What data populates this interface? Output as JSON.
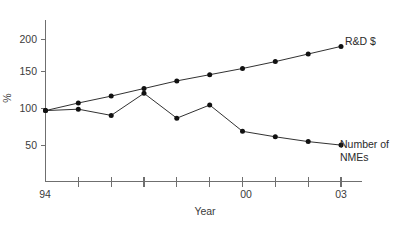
{
  "chart_data": {
    "type": "line",
    "title": "",
    "xlabel": "Year",
    "ylabel": "%",
    "x": [
      94,
      95,
      96,
      97,
      98,
      99,
      0,
      1,
      2,
      3
    ],
    "x_full": [
      1994,
      1995,
      1996,
      1997,
      1998,
      1999,
      2000,
      2001,
      2002,
      2003
    ],
    "xtick_labels_visible": [
      "94",
      "00",
      "03"
    ],
    "xtick_label_indices": [
      0,
      6,
      9
    ],
    "ytick_labels": [
      "50",
      "100",
      "150",
      "200"
    ],
    "ytick_values": [
      50,
      100,
      150,
      200
    ],
    "ylim": [
      0,
      225
    ],
    "xlim": [
      1994,
      2003
    ],
    "grid": false,
    "legend": "inline-right-labels",
    "series": [
      {
        "name": "R&D $",
        "label": "R&D $",
        "color": "#111111",
        "marker": "circle",
        "values": [
          97,
          108,
          118,
          129,
          140,
          149,
          158,
          168,
          179,
          190
        ]
      },
      {
        "name": "Number of NMEs",
        "label_line1": "Number of",
        "label_line2": "NMEs",
        "color": "#111111",
        "marker": "circle",
        "values": [
          97,
          99,
          90,
          122,
          86,
          105,
          67,
          59,
          52,
          47
        ]
      }
    ]
  },
  "axes": {
    "y_axis_title": "%",
    "x_axis_title": "Year",
    "y_tick_200": "200",
    "y_tick_150": "150",
    "y_tick_100": "100",
    "y_tick_50": "50",
    "x_tick_start": "94",
    "x_tick_mid": "00",
    "x_tick_end": "03"
  },
  "labels": {
    "rd_label": "R&D $",
    "nme_label_line1": "Number of",
    "nme_label_line2": "NMEs"
  },
  "colors": {
    "series_stroke": "#111111",
    "axis_stroke": "#6f6f6f",
    "text": "#3b3b3b",
    "background": "#ffffff"
  }
}
